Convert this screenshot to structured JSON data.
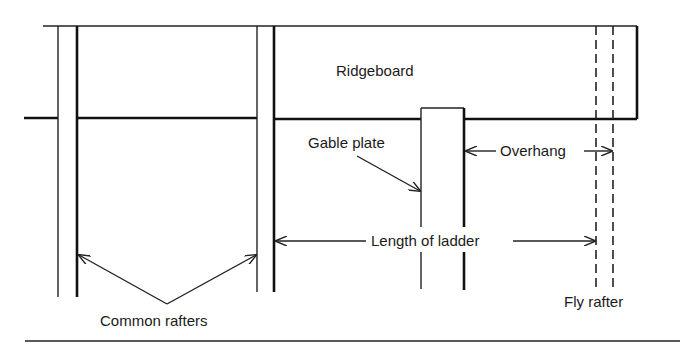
{
  "diagram": {
    "labels": {
      "ridgeboard": "Ridgeboard",
      "gable_plate": "Gable plate",
      "overhang": "Overhang",
      "length_of_ladder": "Length of ladder",
      "common_rafters": "Common rafters",
      "fly_rafter": "Fly rafter"
    },
    "colors": {
      "line": "#111111",
      "background": "#ffffff"
    }
  }
}
